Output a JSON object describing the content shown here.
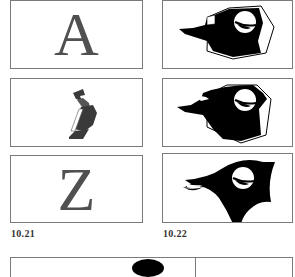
{
  "figures": [
    {
      "id": "fig-10-21",
      "caption": "10.21",
      "panels": [
        {
          "content": "A",
          "kind": "letter"
        },
        {
          "content": "A-to-Z transition",
          "kind": "morph-shape"
        },
        {
          "content": "Z",
          "kind": "letter"
        }
      ]
    },
    {
      "id": "fig-10-22",
      "caption": "10.22",
      "panels": [
        {
          "kind": "bird-head-polygonal"
        },
        {
          "kind": "bird-head-intermediate"
        },
        {
          "kind": "bird-head-smooth"
        }
      ]
    }
  ],
  "colors": {
    "ink": "#000000",
    "letter_gray": "#505050",
    "frame": "#7a7a7a",
    "paper": "#ffffff"
  }
}
